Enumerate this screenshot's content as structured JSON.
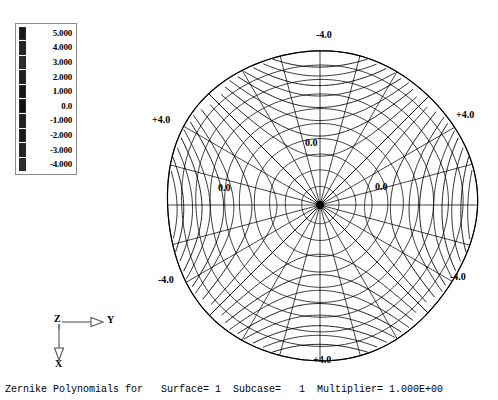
{
  "statusbar": {
    "text": "Zernike Polynomials for   Surface= 1  Subcase=   1  Multiplier= 1.000E+00"
  },
  "legend": {
    "name": "contour-legend",
    "entries": [
      {
        "label": "5.000",
        "color": "#1a1a1a"
      },
      {
        "label": "4.000",
        "color": "#232323"
      },
      {
        "label": "3.000",
        "color": "#2c2c2c"
      },
      {
        "label": "2.000",
        "color": "#1e1e1e"
      },
      {
        "label": "1.000",
        "color": "#151515"
      },
      {
        "label": "0.0",
        "color": "#101010"
      },
      {
        "label": "-1.000",
        "color": "#202020"
      },
      {
        "label": "-2.000",
        "color": "#191919"
      },
      {
        "label": "-3.000",
        "color": "#242424"
      },
      {
        "label": "-4.000",
        "color": "#2e2e2e"
      }
    ]
  },
  "triad": {
    "origin_label": "Z",
    "horizontal_label": "Y",
    "vertical_label": "X"
  },
  "contour_labels": [
    {
      "name": "contour-label-top",
      "text": "-4.0",
      "x": 166,
      "y": 10
    },
    {
      "name": "contour-label-left",
      "text": "+4.0",
      "x": 2,
      "y": 95
    },
    {
      "name": "contour-label-right",
      "text": "+4.0",
      "x": 306,
      "y": 90
    },
    {
      "name": "contour-label-bottom-left",
      "text": "-4.0",
      "x": 8,
      "y": 255
    },
    {
      "name": "contour-label-bottom-right",
      "text": "-4.0",
      "x": 300,
      "y": 252
    },
    {
      "name": "contour-label-bottom",
      "text": "+4.0",
      "x": 163,
      "y": 335
    },
    {
      "name": "contour-label-center-upper",
      "text": "0.0",
      "x": 155,
      "y": 118
    },
    {
      "name": "contour-label-mid-left",
      "text": "0.0",
      "x": 68,
      "y": 163
    },
    {
      "name": "contour-label-mid-right",
      "text": "0.0",
      "x": 225,
      "y": 162
    }
  ],
  "chart_data": {
    "type": "contour",
    "title": "Zernike Polynomials for Surface= 1",
    "subtitle": "Subcase= 1  Multiplier= 1.000E+00",
    "coordinate_system": "polar",
    "domain": "unit circle",
    "mesh": {
      "radial_spokes": 24,
      "rings": 10
    },
    "contour_levels": [
      5.0,
      4.0,
      3.0,
      2.0,
      1.0,
      0.0,
      -1.0,
      -2.0,
      -3.0,
      -4.0
    ],
    "level_extremes": {
      "max": 5.0,
      "min": -4.0
    },
    "labeled_values": [
      "-4.0",
      "+4.0",
      "0.0"
    ],
    "annotations": [
      {
        "position": "top",
        "value": -4.0
      },
      {
        "position": "left",
        "value": 4.0
      },
      {
        "position": "right",
        "value": 4.0
      },
      {
        "position": "bottom-left",
        "value": -4.0
      },
      {
        "position": "bottom-right",
        "value": -4.0
      },
      {
        "position": "bottom",
        "value": 4.0
      },
      {
        "position": "interior-upper",
        "value": 0.0
      },
      {
        "position": "interior-left",
        "value": 0.0
      },
      {
        "position": "interior-right",
        "value": 0.0
      }
    ],
    "xlabel": "Y",
    "ylabel": "X",
    "legend_position": "left",
    "grid": true
  }
}
